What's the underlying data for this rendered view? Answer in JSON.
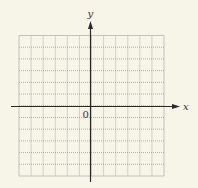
{
  "diagram": {
    "type": "coordinate-plane",
    "background_color": "#f7f5e8",
    "grid": {
      "left": 19,
      "right": 164,
      "top": 35.5,
      "bottom": 176,
      "columns": 12,
      "rows": 12,
      "line_color": "#9a9a9a",
      "border_color": "#b5b5b5",
      "style": "dotted"
    },
    "x_axis": {
      "label": "x",
      "y": 106.5,
      "start": 11,
      "end": 180,
      "arrow": "right",
      "color": "#2a2a2a"
    },
    "y_axis": {
      "label": "y",
      "x": 90.5,
      "start": 182,
      "end": 21,
      "arrow": "up",
      "color": "#2a2a2a"
    },
    "origin": {
      "label": "0"
    }
  }
}
